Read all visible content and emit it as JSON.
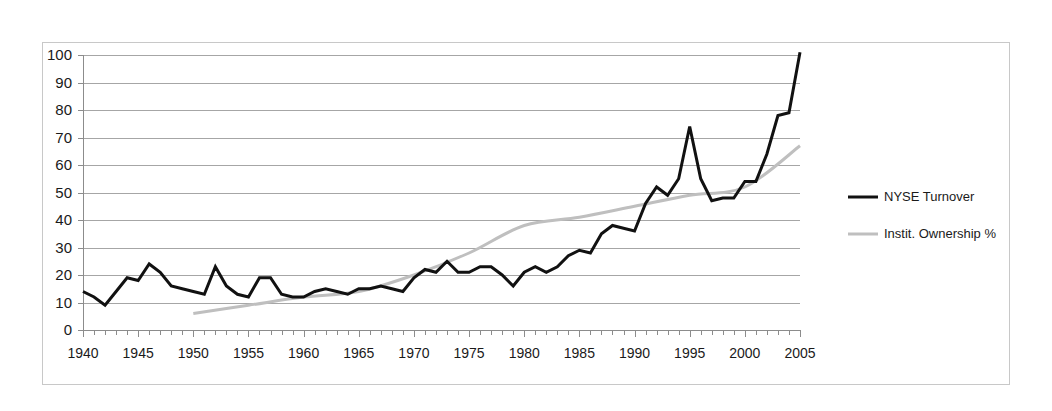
{
  "chart_data": {
    "type": "line",
    "title": "",
    "xlabel": "",
    "ylabel": "",
    "xlim": [
      1940,
      2005
    ],
    "ylim": [
      0,
      100
    ],
    "grid": true,
    "legend_position": "right",
    "x_tick_labels": [
      "1940",
      "1945",
      "1950",
      "1955",
      "1960",
      "1965",
      "1970",
      "1975",
      "1980",
      "1985",
      "1990",
      "1995",
      "2000",
      "2005"
    ],
    "x_tick_values": [
      1940,
      1945,
      1950,
      1955,
      1960,
      1965,
      1970,
      1975,
      1980,
      1985,
      1990,
      1995,
      2000,
      2005
    ],
    "x_minor_tick_step": 1,
    "y_tick_labels": [
      "0",
      "10",
      "20",
      "30",
      "40",
      "50",
      "60",
      "70",
      "80",
      "90",
      "100"
    ],
    "y_tick_values": [
      0,
      10,
      20,
      30,
      40,
      50,
      60,
      70,
      80,
      90,
      100
    ],
    "series": [
      {
        "name": "NYSE Turnover",
        "color": "#111111",
        "width": 3,
        "x": [
          1940,
          1941,
          1942,
          1943,
          1944,
          1945,
          1946,
          1947,
          1948,
          1949,
          1950,
          1951,
          1952,
          1953,
          1954,
          1955,
          1956,
          1957,
          1958,
          1959,
          1960,
          1961,
          1962,
          1963,
          1964,
          1965,
          1966,
          1967,
          1968,
          1969,
          1970,
          1971,
          1972,
          1973,
          1974,
          1975,
          1976,
          1977,
          1978,
          1979,
          1980,
          1981,
          1982,
          1983,
          1984,
          1985,
          1986,
          1987,
          1988,
          1989,
          1990,
          1991,
          1992,
          1993,
          1994,
          1995,
          1996,
          1997,
          1998,
          1999,
          2000,
          2001,
          2002,
          2003,
          2004,
          2005
        ],
        "values": [
          14,
          12,
          9,
          14,
          19,
          18,
          24,
          21,
          16,
          15,
          14,
          13,
          23,
          16,
          13,
          12,
          19,
          19,
          13,
          12,
          12,
          14,
          15,
          14,
          13,
          15,
          16,
          15,
          14,
          15,
          19,
          20,
          21,
          21,
          25,
          23,
          21,
          19,
          24,
          23,
          22,
          16,
          21,
          23,
          21,
          26,
          28,
          29,
          28,
          27,
          34,
          38,
          37,
          36,
          46,
          52,
          49,
          53,
          62,
          74,
          65,
          55,
          55,
          47,
          48,
          48
        ]
      },
      {
        "name": "Instit. Ownership %",
        "color": "#bfbfbf",
        "width": 3,
        "x": [
          1950,
          1955,
          1960,
          1965,
          1970,
          1975,
          1980,
          1985,
          1990,
          1995,
          2000,
          2005
        ],
        "values": [
          6,
          9,
          12,
          14,
          20,
          28,
          38,
          41,
          45,
          49,
          52,
          67
        ]
      }
    ],
    "black_line_trace": [
      [
        1940,
        14
      ],
      [
        1941,
        12
      ],
      [
        1942,
        9
      ],
      [
        1943,
        14
      ],
      [
        1944,
        19
      ],
      [
        1945,
        18
      ],
      [
        1946,
        24
      ],
      [
        1947,
        21
      ],
      [
        1948,
        16
      ],
      [
        1949,
        15
      ],
      [
        1950,
        14
      ],
      [
        1951,
        13
      ],
      [
        1952,
        23
      ],
      [
        1953,
        16
      ],
      [
        1954,
        13
      ],
      [
        1955,
        12
      ],
      [
        1956,
        19
      ],
      [
        1957,
        19
      ],
      [
        1958,
        13
      ],
      [
        1959,
        12
      ],
      [
        1960,
        12
      ],
      [
        1961,
        14
      ],
      [
        1962,
        15
      ],
      [
        1963,
        14
      ],
      [
        1964,
        13
      ],
      [
        1965,
        15
      ],
      [
        1966,
        15
      ],
      [
        1967,
        16
      ],
      [
        1968,
        15
      ],
      [
        1969,
        14
      ],
      [
        1970,
        19
      ],
      [
        1971,
        22
      ],
      [
        1972,
        21
      ],
      [
        1973,
        25
      ],
      [
        1974,
        21
      ],
      [
        1975,
        21
      ],
      [
        1976,
        23
      ],
      [
        1977,
        23
      ],
      [
        1978,
        20
      ],
      [
        1979,
        16
      ],
      [
        1980,
        21
      ],
      [
        1981,
        23
      ],
      [
        1982,
        21
      ],
      [
        1983,
        23
      ],
      [
        1984,
        27
      ],
      [
        1985,
        29
      ],
      [
        1986,
        28
      ],
      [
        1987,
        35
      ],
      [
        1988,
        38
      ],
      [
        1989,
        37
      ],
      [
        1990,
        36
      ],
      [
        1991,
        46
      ],
      [
        1992,
        52
      ],
      [
        1993,
        49
      ],
      [
        1994,
        55
      ],
      [
        1995,
        74
      ],
      [
        1996,
        55
      ],
      [
        1997,
        47
      ],
      [
        1998,
        48
      ],
      [
        1999,
        48
      ],
      [
        2000,
        54
      ],
      [
        2001,
        54
      ],
      [
        2002,
        64
      ],
      [
        2003,
        78
      ],
      [
        2004,
        79
      ],
      [
        2005,
        101
      ]
    ],
    "key_annotations": {
      "peak_year": 1987,
      "peak_value": 74,
      "trough_after_peak_year": 1990,
      "trough_after_peak_value": 47,
      "final_turnover_value": 101,
      "final_ownership_value": 67,
      "ownership_start_year": 1950,
      "ownership_start_value": 6
    }
  },
  "legend": {
    "items": [
      {
        "label": "NYSE Turnover",
        "color": "#111111",
        "width": 3
      },
      {
        "label": "Instit. Ownership %",
        "color": "#bfbfbf",
        "width": 3
      }
    ]
  }
}
